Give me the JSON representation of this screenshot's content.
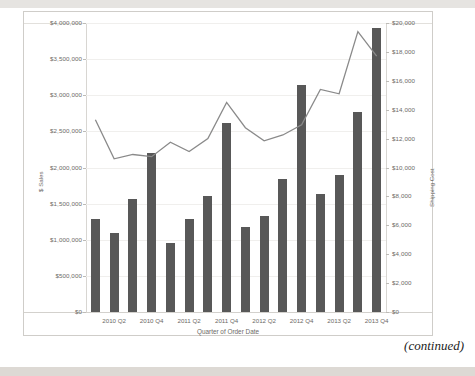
{
  "page": {
    "continued_note": "(continued)",
    "caption_fragment": ""
  },
  "chart_data": {
    "type": "bar",
    "title": "",
    "xlabel": "Quarter of Order Date",
    "ylabel": "$ Sales",
    "y2label": "Shipping Cost",
    "grid": true,
    "legend": "none",
    "ylim": [
      0,
      4000000
    ],
    "y2lim": [
      0,
      20000
    ],
    "categories": [
      "2010 Q1",
      "2010 Q2",
      "2010 Q3",
      "2010 Q4",
      "2011 Q1",
      "2011 Q2",
      "2011 Q3",
      "2011 Q4",
      "2012 Q1",
      "2012 Q2",
      "2012 Q3",
      "2012 Q4",
      "2013 Q1",
      "2013 Q2",
      "2013 Q3",
      "2013 Q4"
    ],
    "xtick_labels": [
      "2010 Q2",
      "2010 Q4",
      "2011 Q2",
      "2011 Q4",
      "2012 Q2",
      "2012 Q4",
      "2013 Q2",
      "2013 Q4"
    ],
    "xtick_indices": [
      1,
      3,
      5,
      7,
      9,
      11,
      13,
      15
    ],
    "ytick_labels": [
      "$4,000,000",
      "$3,500,000",
      "$3,000,000",
      "$2,500,000",
      "$2,000,000",
      "$1,500,000",
      "$1,000,000",
      "$500,000",
      "$0"
    ],
    "ytick_values": [
      4000000,
      3500000,
      3000000,
      2500000,
      2000000,
      1500000,
      1000000,
      500000,
      0
    ],
    "y2tick_labels": [
      "$20,000",
      "$18,000",
      "$16,000",
      "$14,000",
      "$12,000",
      "$10,000",
      "$8,000",
      "$6,000",
      "$4,000",
      "$2,000",
      "$0"
    ],
    "y2tick_values": [
      20000,
      18000,
      16000,
      14000,
      12000,
      10000,
      8000,
      6000,
      4000,
      2000,
      0
    ],
    "series": [
      {
        "name": "$ Sales",
        "render": "bar",
        "axis": "left",
        "color": "#585858",
        "values": [
          1290000,
          1100000,
          1560000,
          2200000,
          950000,
          1290000,
          1600000,
          2610000,
          1180000,
          1330000,
          1840000,
          3140000,
          1640000,
          1900000,
          2770000,
          3930000
        ]
      },
      {
        "name": "Shipping Cost",
        "render": "line",
        "axis": "right",
        "color": "#8a8a8a",
        "values": [
          13300,
          10600,
          10900,
          10750,
          11750,
          11100,
          12000,
          14500,
          12750,
          11850,
          12250,
          12950,
          15400,
          15100,
          19400,
          17700
        ]
      }
    ]
  }
}
